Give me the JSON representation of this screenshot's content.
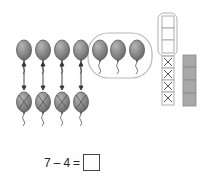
{
  "diagram": {
    "top_row_balloons": 7,
    "crossed_balloons": 4,
    "circled_remaining": 3,
    "tower_cells": {
      "total": 7,
      "outlined_uncrossed": 3,
      "crossed": 4
    },
    "shaded_cubes": 4,
    "colors": {
      "balloon_fill": "#8a8a8a",
      "balloon_stroke": "#555555",
      "ellipse": "#b8b8b8",
      "cube": "#a8a8a8"
    }
  },
  "equation": {
    "left": "7",
    "operator": "–",
    "right": "4",
    "equals": "=",
    "answer": ""
  }
}
